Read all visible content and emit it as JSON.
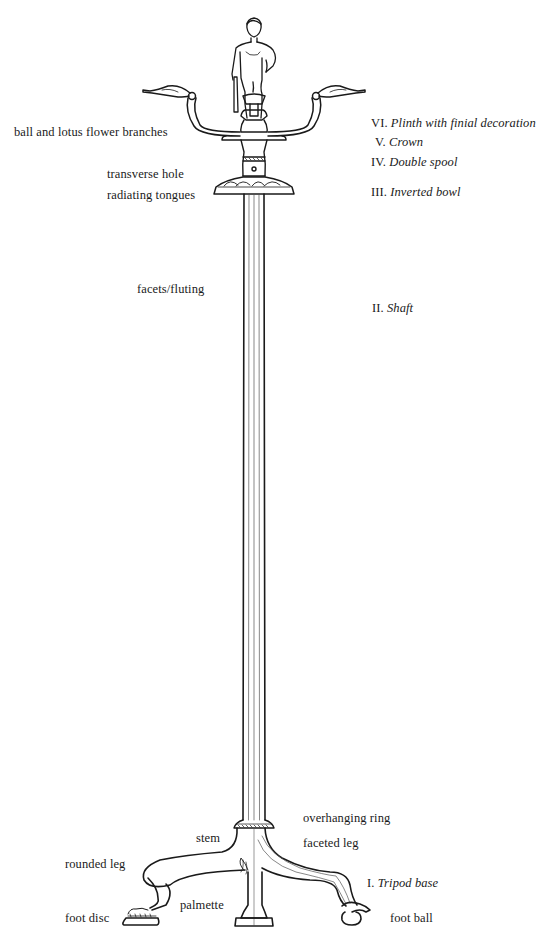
{
  "diagram": {
    "parts_left": [
      {
        "id": "branches",
        "text": "ball and lotus flower branches",
        "x": 14,
        "y": 126
      },
      {
        "id": "hole",
        "text": "transverse hole",
        "x": 107,
        "y": 168
      },
      {
        "id": "tongues",
        "text": "radiating tongues",
        "x": 107,
        "y": 189
      },
      {
        "id": "fluting",
        "text": "facets/fluting",
        "x": 137,
        "y": 283
      },
      {
        "id": "stem",
        "text": "stem",
        "x": 196,
        "y": 832
      },
      {
        "id": "rounded-leg",
        "text": "rounded leg",
        "x": 65,
        "y": 858
      },
      {
        "id": "palmette",
        "text": "palmette",
        "x": 180,
        "y": 899
      },
      {
        "id": "foot-disc",
        "text": "foot disc",
        "x": 65,
        "y": 912
      }
    ],
    "parts_right": [
      {
        "id": "ring",
        "text": "overhanging ring",
        "x": 303,
        "y": 812
      },
      {
        "id": "faceted-leg",
        "text": "faceted leg",
        "x": 303,
        "y": 837
      },
      {
        "id": "foot-ball",
        "text": "foot ball",
        "x": 390,
        "y": 912
      }
    ],
    "sections": [
      {
        "numeral": "VI.",
        "name": "Plinth with finial decoration",
        "x": 371,
        "y": 117
      },
      {
        "numeral": "V.",
        "name": "Crown",
        "x": 375,
        "y": 136
      },
      {
        "numeral": "IV.",
        "name": "Double spool",
        "x": 371,
        "y": 156
      },
      {
        "numeral": "III.",
        "name": "Inverted bowl",
        "x": 371,
        "y": 186
      },
      {
        "numeral": "II.",
        "name": "Shaft",
        "x": 372,
        "y": 302
      },
      {
        "numeral": "I.",
        "name": "Tripod base",
        "x": 367,
        "y": 877
      }
    ],
    "colors": {
      "line": "#1a1a1a",
      "fine_line": "#555555",
      "background": "#ffffff"
    }
  }
}
